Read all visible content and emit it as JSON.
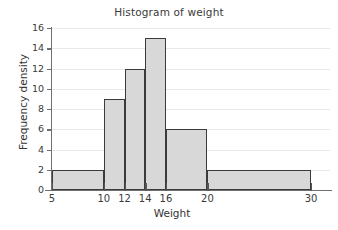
{
  "chart_data": {
    "type": "bar",
    "title": "Histogram of weight",
    "xlabel": "Weight",
    "ylabel": "Frequency density",
    "grid": true,
    "legend": null,
    "xlim": [
      5,
      30
    ],
    "ylim": [
      0,
      16
    ],
    "xticks": [
      5,
      10,
      12,
      14,
      16,
      20,
      30
    ],
    "xtick_labels": [
      "5",
      "10",
      "12",
      "14",
      "16",
      "20",
      "30"
    ],
    "yticks": [
      0,
      2,
      4,
      6,
      8,
      10,
      12,
      14,
      16
    ],
    "ytick_labels": [
      "0",
      "2",
      "4",
      "6",
      "8",
      "10",
      "12",
      "14",
      "16"
    ],
    "bin_edges": [
      5,
      10,
      12,
      14,
      16,
      20,
      30
    ],
    "bins": [
      {
        "label": "5-10",
        "x0": 5,
        "x1": 10,
        "value": 2
      },
      {
        "label": "10-12",
        "x0": 10,
        "x1": 12,
        "value": 9
      },
      {
        "label": "12-14",
        "x0": 12,
        "x1": 14,
        "value": 12
      },
      {
        "label": "14-16",
        "x0": 14,
        "x1": 16,
        "value": 15
      },
      {
        "label": "16-20",
        "x0": 16,
        "x1": 20,
        "value": 6
      },
      {
        "label": "20-30",
        "x0": 20,
        "x1": 30,
        "value": 2
      }
    ],
    "values": [
      2,
      9,
      12,
      15,
      6,
      2
    ],
    "categories": [
      "5-10",
      "10-12",
      "12-14",
      "14-16",
      "16-20",
      "20-30"
    ]
  },
  "style": {
    "bar_fill": "#d8d8d8",
    "bar_stroke": "#3b3b3b",
    "gridline": "#e9e9e9",
    "axis": "#6f6f6f",
    "text": "#333333",
    "background": "#ffffff"
  }
}
